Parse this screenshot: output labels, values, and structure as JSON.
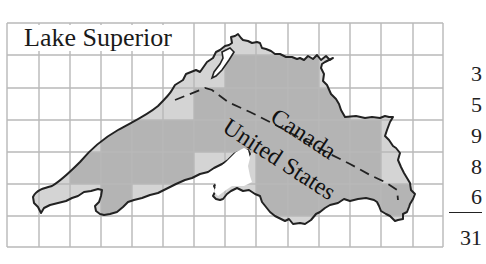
{
  "title": "Lake Superior",
  "labels": {
    "north": "Canada",
    "south": "United States"
  },
  "grid": {
    "columns": 14,
    "rows": 7,
    "line_color": "#b8b8b8"
  },
  "colors": {
    "full_square": "#b4b4b4",
    "partial_square": "#d4d4d4",
    "outline": "#222222",
    "border_line": "#222222"
  },
  "row_counts": {
    "values": [
      "3",
      "5",
      "9",
      "8",
      "6"
    ],
    "total": "31"
  }
}
